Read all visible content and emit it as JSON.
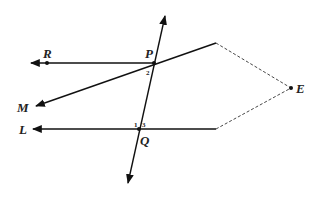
{
  "diagram": {
    "type": "geometry",
    "points": {
      "R": {
        "label": "R",
        "x": 47,
        "y": 63
      },
      "P": {
        "label": "P",
        "x": 154,
        "y": 63
      },
      "M": {
        "label": "M",
        "x": 35,
        "y": 106
      },
      "L": {
        "label": "L",
        "x": 32,
        "y": 129
      },
      "Q": {
        "label": "Q",
        "x": 139,
        "y": 129
      },
      "E": {
        "label": "E",
        "x": 291,
        "y": 88
      }
    },
    "angles": {
      "a1": "1",
      "a2": "2",
      "a3": "3"
    },
    "colors": {
      "line": "#111111",
      "dashed": "#333333"
    }
  }
}
